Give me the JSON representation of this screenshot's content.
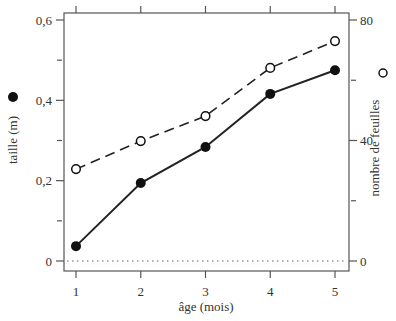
{
  "chart_data": {
    "type": "line",
    "title": "",
    "xlabel": "âge (mois)",
    "x": [
      1,
      2,
      3,
      4,
      5
    ],
    "x_ticks": [
      "1",
      "2",
      "3",
      "4",
      "5"
    ],
    "xlim": [
      0.8,
      5.2
    ],
    "y_left": {
      "label": "taille (m)",
      "ticks": [
        "0",
        "0,2",
        "0,4",
        "0,6"
      ],
      "tick_values": [
        0,
        0.2,
        0.4,
        0.6
      ],
      "minor_ticks": [
        0.1,
        0.3,
        0.5
      ],
      "ylim": [
        -0.025,
        0.615
      ]
    },
    "y_right": {
      "label": "nombre de feuilles",
      "ticks": [
        "0",
        "40",
        "80"
      ],
      "tick_values": [
        0,
        40,
        80
      ],
      "minor_ticks": [
        20,
        60
      ],
      "ylim": [
        -3.3,
        82
      ]
    },
    "series": [
      {
        "name": "taille (m)",
        "axis": "left",
        "marker": "filled-circle",
        "line": "solid",
        "values": [
          0.037,
          0.194,
          0.284,
          0.416,
          0.475
        ]
      },
      {
        "name": "nombre de feuilles",
        "axis": "right",
        "marker": "open-circle",
        "line": "dashed",
        "values": [
          30.5,
          39.8,
          48.1,
          64.1,
          73.0
        ]
      }
    ],
    "reference_line": {
      "axis": "left",
      "value": 0,
      "style": "dotted"
    },
    "grid": false,
    "legend": "markers beside axis labels"
  },
  "colors": {
    "line": "#222222",
    "frame": "#555555",
    "text": "#333333"
  }
}
